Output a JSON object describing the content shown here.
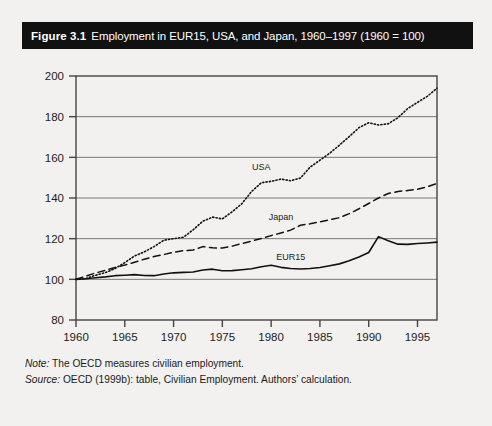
{
  "figure": {
    "number_label": "Figure 3.1",
    "caption": "Employment in EUR15, USA, and Japan, 1960–1997 (1960 = 100)"
  },
  "footnotes": {
    "note_kicker": "Note:",
    "note_text": " The OECD measures civilian employment.",
    "source_kicker": "Source:",
    "source_text": " OECD (1999b): table, Civilian Employment. Authors’ calculation."
  },
  "chart_data": {
    "type": "line",
    "title": "Employment in EUR15, USA, and Japan, 1960–1997 (1960 = 100)",
    "xlabel": "",
    "ylabel": "",
    "xlim": [
      1960,
      1997
    ],
    "ylim": [
      80,
      200
    ],
    "yticks": [
      80,
      100,
      120,
      140,
      160,
      180,
      200
    ],
    "xticks": [
      1960,
      1965,
      1970,
      1975,
      1980,
      1985,
      1990,
      1995
    ],
    "grid": "horizontal",
    "legend": "inline-labels",
    "index_base": "1960 = 100",
    "x": [
      1960,
      1961,
      1962,
      1963,
      1964,
      1965,
      1966,
      1967,
      1968,
      1969,
      1970,
      1971,
      1972,
      1973,
      1974,
      1975,
      1976,
      1977,
      1978,
      1979,
      1980,
      1981,
      1982,
      1983,
      1984,
      1985,
      1986,
      1987,
      1988,
      1989,
      1990,
      1991,
      1992,
      1993,
      1994,
      1995,
      1996,
      1997
    ],
    "series": [
      {
        "name": "EUR15",
        "style": "solid",
        "color": "#111111",
        "label_x": 1982,
        "label_y": 109.5,
        "values": [
          100.0,
          100.3,
          100.8,
          101.2,
          101.8,
          102.0,
          102.3,
          101.9,
          101.8,
          102.6,
          103.2,
          103.4,
          103.6,
          104.6,
          105.0,
          104.2,
          104.3,
          104.7,
          105.2,
          106.2,
          106.9,
          105.9,
          105.3,
          105.1,
          105.3,
          105.8,
          106.7,
          107.6,
          109.1,
          111.0,
          113.2,
          121.0,
          119.0,
          117.3,
          117.2,
          117.6,
          117.9,
          118.3
        ]
      },
      {
        "name": "Japan",
        "style": "dashed",
        "color": "#111111",
        "label_x": 1981,
        "label_y": 129.0,
        "values": [
          100.0,
          101.6,
          103.1,
          104.4,
          105.8,
          107.0,
          108.4,
          109.9,
          111.2,
          112.2,
          113.3,
          114.1,
          114.4,
          116.1,
          115.5,
          115.4,
          116.3,
          117.6,
          118.8,
          120.1,
          121.5,
          122.8,
          124.2,
          126.6,
          127.3,
          128.3,
          129.3,
          130.3,
          132.3,
          134.7,
          137.3,
          140.0,
          142.2,
          143.2,
          143.7,
          144.3,
          145.5,
          147.2
        ]
      },
      {
        "name": "USA",
        "style": "dotted",
        "color": "#111111",
        "label_x": 1979,
        "label_y": 154.0,
        "values": [
          100.0,
          100.4,
          102.0,
          103.3,
          105.3,
          108.2,
          111.5,
          113.5,
          116.1,
          119.2,
          120.0,
          120.7,
          124.3,
          128.6,
          130.6,
          129.7,
          133.2,
          137.2,
          143.2,
          147.5,
          148.2,
          149.3,
          148.5,
          149.8,
          155.2,
          158.6,
          162.0,
          166.0,
          170.2,
          174.6,
          177.0,
          175.9,
          176.5,
          179.5,
          184.0,
          187.0,
          190.0,
          194.0
        ]
      }
    ]
  }
}
